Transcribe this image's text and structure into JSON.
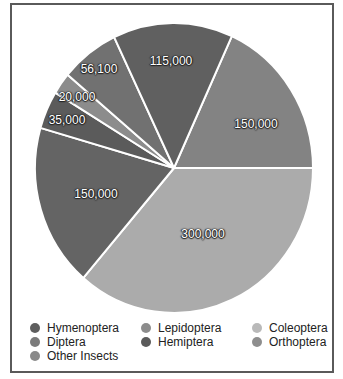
{
  "chart_data": {
    "type": "pie",
    "title": "",
    "center": [
      174,
      168
    ],
    "radius": [
      139,
      145
    ],
    "start_angle_deg": 24.6,
    "slices": [
      {
        "name": "Lepidoptera",
        "value": 150000,
        "label": "150,000",
        "color": "#838383",
        "label_pos": [
          256,
          124
        ]
      },
      {
        "name": "Coleoptera",
        "value": 300000,
        "label": "300,000",
        "color": "#ababab",
        "label_pos": [
          203,
          234
        ]
      },
      {
        "name": "Hymenoptera",
        "value": 150000,
        "label": "150,000",
        "color": "#646464",
        "label_pos": [
          96,
          194
        ]
      },
      {
        "name": "Diptera",
        "value": 35000,
        "label": "35,000",
        "color": "#5b5b5b",
        "label_pos": [
          67,
          120
        ]
      },
      {
        "name": "Other Insects",
        "value": 20000,
        "label": "20,000",
        "color": "#8c8c8c",
        "label_pos": [
          77,
          97
        ]
      },
      {
        "name": "Orthoptera",
        "value": 56100,
        "label": "56,100",
        "color": "#717171",
        "label_pos": [
          99,
          69
        ]
      },
      {
        "name": "Hemiptera",
        "value": 115000,
        "label": "115,000",
        "color": "#606060",
        "label_pos": [
          171,
          61
        ]
      }
    ],
    "legend": {
      "position": "bottom",
      "entries": [
        {
          "label": "Hymenoptera",
          "color": "#5e5e5e",
          "pos": [
            30,
            328
          ]
        },
        {
          "label": "Lepidoptera",
          "color": "#8c8c8c",
          "pos": [
            141,
            328
          ]
        },
        {
          "label": "Coleoptera",
          "color": "#b9b9b9",
          "pos": [
            252,
            328
          ]
        },
        {
          "label": "Diptera",
          "color": "#7b7b7b",
          "pos": [
            30,
            342
          ]
        },
        {
          "label": "Hemiptera",
          "color": "#5a5a5a",
          "pos": [
            141,
            342
          ]
        },
        {
          "label": "Orthoptera",
          "color": "#8e8e8e",
          "pos": [
            252,
            342
          ]
        },
        {
          "label": "Other Insects",
          "color": "#8a8a8a",
          "pos": [
            30,
            356
          ]
        }
      ]
    }
  }
}
